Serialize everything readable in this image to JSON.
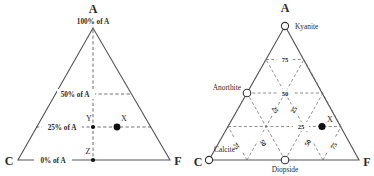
{
  "figure": {
    "type": "ternary-diagram-pair"
  },
  "left_diagram": {
    "name": "percent-of-A ternary",
    "vertices": {
      "top": "A",
      "bottom_left": "C",
      "bottom_right": "F"
    },
    "contour_labels": [
      {
        "id": "pct-100",
        "value": "100",
        "text": "100% of A",
        "prefix": "100%",
        "suffix": "of A"
      },
      {
        "id": "pct-50",
        "value": "50",
        "text": "50% of A",
        "prefix": "50%",
        "suffix": "of A"
      },
      {
        "id": "pct-25",
        "value": "25",
        "text": "25% of A",
        "prefix": "25%",
        "suffix": "of A"
      },
      {
        "id": "pct-0",
        "value": "0",
        "text": "0% of A",
        "prefix": "0%",
        "suffix": "of A"
      }
    ],
    "points": [
      {
        "label": "X",
        "style": "filled-circle",
        "a_percent": 25
      },
      {
        "label": "Y",
        "style": "small-filled-dot",
        "a_percent": 25
      },
      {
        "label": "Z",
        "style": "small-filled-dot",
        "a_percent": 0
      }
    ]
  },
  "right_diagram": {
    "name": "ACF mineral ternary",
    "vertices": {
      "top": "A",
      "bottom_left": "C",
      "bottom_right": "F"
    },
    "minerals": [
      {
        "label": "Kyanite",
        "style": "open-circle",
        "position": "A apex"
      },
      {
        "label": "Anorthite",
        "style": "open-circle",
        "position": "left edge, 50% A"
      },
      {
        "label": "Calcite",
        "style": "open-circle",
        "position": "C apex"
      },
      {
        "label": "Diopside",
        "style": "open-circle",
        "position": "base midpoint"
      }
    ],
    "points": [
      {
        "label": "X",
        "style": "filled-circle"
      }
    ],
    "grid_labels": {
      "horizontal": [
        "75",
        "50",
        "25"
      ],
      "left_diagonal": [
        "25",
        "50",
        "75"
      ],
      "right_diagonal": [
        "25",
        "50",
        "75"
      ]
    },
    "grid_values": [
      "75",
      "50",
      "25",
      "25",
      "50",
      "75",
      "25",
      "50",
      "75"
    ]
  },
  "colors": {
    "line": "#555555",
    "dashed": "#4a4a4a",
    "text": "#2a2a2a",
    "point_fill": "#111111",
    "open_fill": "#ffffff",
    "background": "#ffffff"
  }
}
